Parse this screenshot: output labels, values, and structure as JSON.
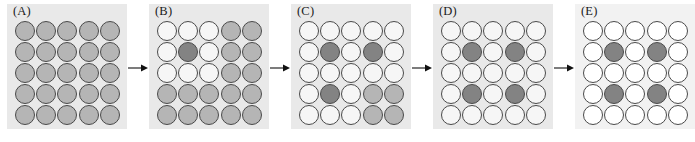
{
  "figure": {
    "panel_count": 5,
    "grid_rows": 5,
    "grid_cols": 5,
    "arrow_glyph": "right-arrow",
    "arrow_count": 4,
    "background_color": "#ffffff"
  },
  "colors": {
    "circle_gray": "#b5b5b5",
    "circle_white": "#f6f6f6",
    "circle_bright_white": "#ffffff",
    "circle_dark": "#838383",
    "circle_outline": "#4a4a4a",
    "panel_background": "#e9e9e9",
    "panel_background_light": "#f2f2f2",
    "arrow_color": "#111111",
    "label_color": "#1a1a1a"
  },
  "legend": {
    "state_gray": "gray",
    "state_white": "white",
    "state_dark": "dark"
  },
  "panels": [
    {
      "id": "panel-a",
      "label": "(A)",
      "background": "#e9e9e9",
      "white_tone": "#f6f6f6",
      "cells": [
        [
          "gray",
          "gray",
          "gray",
          "gray",
          "gray"
        ],
        [
          "gray",
          "gray",
          "gray",
          "gray",
          "gray"
        ],
        [
          "gray",
          "gray",
          "gray",
          "gray",
          "gray"
        ],
        [
          "gray",
          "gray",
          "gray",
          "gray",
          "gray"
        ],
        [
          "gray",
          "gray",
          "gray",
          "gray",
          "gray"
        ]
      ]
    },
    {
      "id": "panel-b",
      "label": "(B)",
      "background": "#e9e9e9",
      "white_tone": "#f6f6f6",
      "cells": [
        [
          "white",
          "white",
          "white",
          "gray",
          "gray"
        ],
        [
          "white",
          "dark",
          "white",
          "gray",
          "gray"
        ],
        [
          "white",
          "white",
          "white",
          "gray",
          "gray"
        ],
        [
          "gray",
          "gray",
          "gray",
          "gray",
          "gray"
        ],
        [
          "gray",
          "gray",
          "gray",
          "gray",
          "gray"
        ]
      ]
    },
    {
      "id": "panel-c",
      "label": "(C)",
      "background": "#e9e9e9",
      "white_tone": "#f6f6f6",
      "cells": [
        [
          "white",
          "white",
          "white",
          "white",
          "white"
        ],
        [
          "white",
          "dark",
          "white",
          "dark",
          "white"
        ],
        [
          "white",
          "white",
          "white",
          "white",
          "white"
        ],
        [
          "white",
          "dark",
          "white",
          "gray",
          "gray"
        ],
        [
          "white",
          "white",
          "white",
          "gray",
          "gray"
        ]
      ]
    },
    {
      "id": "panel-d",
      "label": "(D)",
      "background": "#e9e9e9",
      "white_tone": "#f6f6f6",
      "cells": [
        [
          "white",
          "white",
          "white",
          "white",
          "white"
        ],
        [
          "white",
          "dark",
          "white",
          "dark",
          "white"
        ],
        [
          "white",
          "white",
          "white",
          "white",
          "white"
        ],
        [
          "white",
          "dark",
          "white",
          "dark",
          "white"
        ],
        [
          "white",
          "white",
          "white",
          "white",
          "white"
        ]
      ]
    },
    {
      "id": "panel-e",
      "label": "(E)",
      "background": "#f2f2f2",
      "white_tone": "#ffffff",
      "cells": [
        [
          "white",
          "white",
          "white",
          "white",
          "white"
        ],
        [
          "white",
          "dark",
          "white",
          "dark",
          "white"
        ],
        [
          "white",
          "white",
          "white",
          "white",
          "white"
        ],
        [
          "white",
          "dark",
          "white",
          "dark",
          "white"
        ],
        [
          "white",
          "white",
          "white",
          "white",
          "white"
        ]
      ]
    }
  ]
}
